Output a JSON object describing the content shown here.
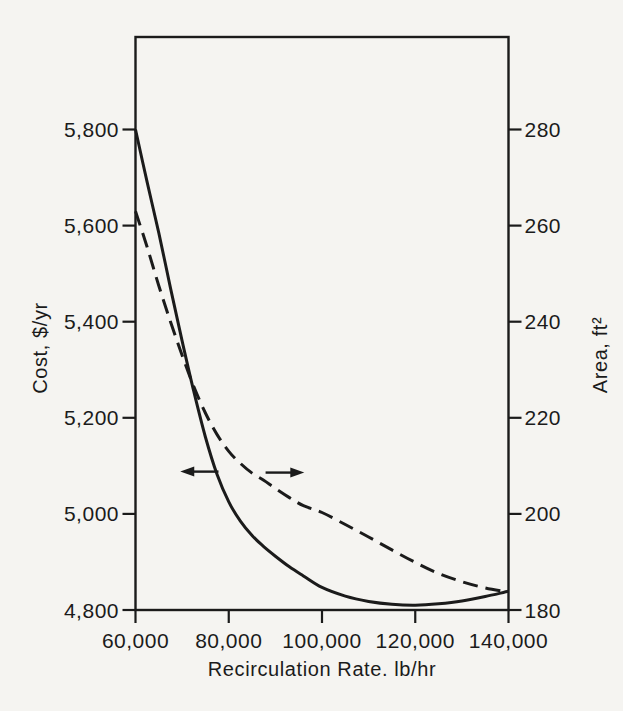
{
  "figure": {
    "background": "#f5f4f1",
    "ink": "#1b1b1b"
  },
  "chart_data": {
    "type": "line",
    "title": "",
    "xlabel": "Recirculation Rate. lb/hr",
    "ylabel_left": "Cost, $/yr",
    "ylabel_right": "Area, ft²",
    "grid": false,
    "legend": "none",
    "x_axis": {
      "min": 60000,
      "max": 140000,
      "tick_values": [
        60000,
        80000,
        100000,
        120000,
        140000
      ],
      "tick_labels": [
        "60,000",
        "80,000",
        "100,000",
        "120,000",
        "140,000"
      ]
    },
    "y_left_axis": {
      "unit": "$/yr",
      "axis_bottom": 4800,
      "tick_values": [
        5800,
        5600,
        5400,
        5200,
        5000,
        4800
      ],
      "tick_labels": [
        "5,800",
        "5,600",
        "5,400",
        "5,200",
        "5,000",
        "4,800"
      ]
    },
    "y_right_axis": {
      "unit": "ft2",
      "axis_bottom": 180,
      "tick_values": [
        280,
        260,
        240,
        220,
        200,
        180
      ],
      "tick_labels": [
        "280",
        "260",
        "240",
        "220",
        "200",
        "180"
      ]
    },
    "series": [
      {
        "name": "annual-cost",
        "style": "solid",
        "axis": "left",
        "points": [
          [
            60000,
            5800
          ],
          [
            62500,
            5690
          ],
          [
            65000,
            5585
          ],
          [
            67500,
            5470
          ],
          [
            70000,
            5360
          ],
          [
            72500,
            5255
          ],
          [
            75000,
            5160
          ],
          [
            77500,
            5082
          ],
          [
            80000,
            5025
          ],
          [
            82500,
            4985
          ],
          [
            85000,
            4955
          ],
          [
            87500,
            4932
          ],
          [
            90000,
            4912
          ],
          [
            93000,
            4890
          ],
          [
            96000,
            4871
          ],
          [
            100000,
            4847
          ],
          [
            105000,
            4829
          ],
          [
            110000,
            4818
          ],
          [
            115000,
            4812
          ],
          [
            120000,
            4810
          ],
          [
            125000,
            4813
          ],
          [
            130000,
            4819
          ],
          [
            135000,
            4828
          ],
          [
            140000,
            4839
          ]
        ]
      },
      {
        "name": "exchanger-area",
        "style": "dashed",
        "axis": "right",
        "points": [
          [
            60000,
            263.0
          ],
          [
            62500,
            255.5
          ],
          [
            65000,
            247.5
          ],
          [
            67500,
            240.0
          ],
          [
            70000,
            233.0
          ],
          [
            72500,
            226.5
          ],
          [
            75000,
            221.0
          ],
          [
            77500,
            216.5
          ],
          [
            80000,
            213.0
          ],
          [
            82500,
            210.5
          ],
          [
            85000,
            208.5
          ],
          [
            87500,
            207.0
          ],
          [
            90000,
            205.3
          ],
          [
            93000,
            203.4
          ],
          [
            96000,
            201.7
          ],
          [
            100000,
            200.3
          ],
          [
            105000,
            197.8
          ],
          [
            110000,
            195.2
          ],
          [
            115000,
            192.5
          ],
          [
            120000,
            189.9
          ],
          [
            125000,
            187.6
          ],
          [
            130000,
            185.9
          ],
          [
            135000,
            184.6
          ],
          [
            140000,
            183.7
          ]
        ]
      }
    ],
    "annotations": {
      "left_arrow": {
        "meaning": "solid cost curve is read on the left axis",
        "at_cost": 5088,
        "from_rate": 77800,
        "to_rate": 69600,
        "direction": "left"
      },
      "right_arrow": {
        "meaning": "dashed area curve is read on the right axis",
        "at_area": 208.6,
        "from_rate": 87900,
        "to_rate": 96200,
        "direction": "right"
      }
    }
  }
}
